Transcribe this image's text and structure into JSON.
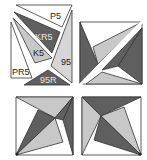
{
  "colors": {
    "dark": "#5f5f5f",
    "light": "#c8c8c8",
    "white": "#ffffff",
    "stroke": "#333333",
    "label_on_dark": "#e6e6e6",
    "label_on_light": "#222222"
  },
  "exploded_square": {
    "pieces": [
      {
        "label": "P5",
        "shade": "white"
      },
      {
        "label": "KR5",
        "shade": "dark"
      },
      {
        "label": "K5",
        "shade": "light"
      },
      {
        "label": "95",
        "shade": "light"
      },
      {
        "label": "PR5",
        "shade": "white"
      },
      {
        "label": "95R",
        "shade": "dark"
      }
    ]
  },
  "assembled_squares": [
    {
      "position": "top-right"
    },
    {
      "position": "bottom-left"
    },
    {
      "position": "bottom-right"
    }
  ]
}
